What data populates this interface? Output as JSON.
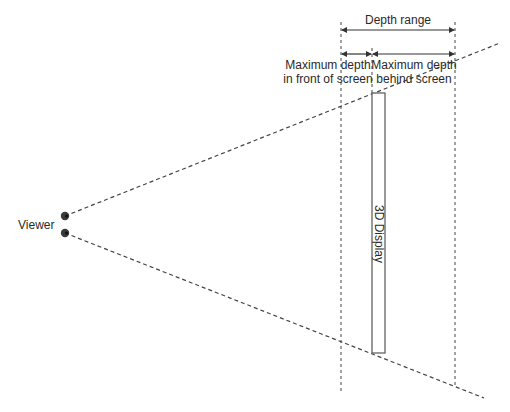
{
  "diagram": {
    "labels": {
      "viewer": "Viewer",
      "depth_range": "Depth range",
      "front_line1": "Maximum depth",
      "front_line2": "in front of screen",
      "behind_line1": "Maximum depth",
      "behind_line2": "behind screen",
      "display": "3D Display"
    },
    "colors": {
      "stroke": "#444444",
      "text": "#2a2a2a",
      "eye_fill": "#3a3a3a",
      "display_fill": "#ffffff"
    },
    "nodes": [
      {
        "id": "viewer",
        "label": "Viewer"
      },
      {
        "id": "display",
        "label": "3D Display"
      }
    ],
    "dimensions": [
      {
        "id": "depth-range",
        "label": "Depth range"
      },
      {
        "id": "front-depth",
        "label": "Maximum depth in front of screen"
      },
      {
        "id": "behind-depth",
        "label": "Maximum depth behind screen"
      }
    ]
  }
}
